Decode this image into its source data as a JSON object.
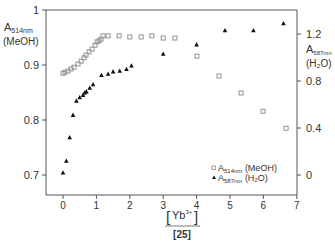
{
  "chart_data": {
    "type": "scatter",
    "title": "",
    "xlabel": "[Yb3+]/[25]",
    "xlabel_parts": {
      "num_main": "Yb",
      "num_sup": "3+",
      "den": "[25]"
    },
    "xlim": [
      -0.5,
      7
    ],
    "xticks": [
      0,
      1,
      2,
      3,
      4,
      5,
      6,
      7
    ],
    "y_left": {
      "label_main": "A",
      "label_sub": "514nm",
      "label_line2": "(MeOH)",
      "ylim": [
        0.66,
        1.0
      ],
      "ticks": [
        0.7,
        0.8,
        0.9,
        1
      ]
    },
    "y_right": {
      "label_main": "A",
      "label_sub": "587nm",
      "label_line2": "(H₂O)",
      "ylim": [
        -0.17,
        1.47
      ],
      "ticks": [
        0,
        0.4,
        0.8,
        1.2
      ]
    },
    "grid": false,
    "legend_position": "lower right",
    "series": [
      {
        "name": "A514nm (MeOH)",
        "legend_main": "A",
        "legend_sub": "514nm",
        "legend_rest": " (MeOH)",
        "marker": "open-square",
        "axis": "left",
        "x": [
          0.0,
          0.06,
          0.15,
          0.24,
          0.33,
          0.45,
          0.54,
          0.63,
          0.69,
          0.78,
          0.87,
          0.96,
          1.02,
          1.08,
          1.14,
          1.2,
          1.35,
          1.68,
          2.0,
          2.34,
          2.66,
          3.0,
          3.35,
          4.01,
          4.67,
          5.33,
          5.99,
          6.68
        ],
        "y": [
          0.885,
          0.887,
          0.889,
          0.893,
          0.896,
          0.902,
          0.907,
          0.913,
          0.918,
          0.924,
          0.929,
          0.936,
          0.942,
          0.944,
          0.947,
          0.953,
          0.953,
          0.953,
          0.951,
          0.951,
          0.953,
          0.949,
          0.949,
          0.916,
          0.88,
          0.849,
          0.816,
          0.785
        ]
      },
      {
        "name": "A587nm (H2O)",
        "legend_main": "A",
        "legend_sub": "587nm",
        "legend_rest": " (H₂O)",
        "marker": "filled-triangle",
        "axis": "right",
        "x": [
          0.0,
          0.1,
          0.2,
          0.3,
          0.4,
          0.5,
          0.6,
          0.65,
          0.7,
          0.8,
          0.9,
          1.15,
          1.35,
          1.5,
          1.7,
          1.9,
          2.05,
          3.0,
          4.0,
          4.85,
          5.7,
          6.6
        ],
        "y": [
          0.02,
          0.12,
          0.32,
          0.51,
          0.63,
          0.66,
          0.68,
          0.7,
          0.71,
          0.74,
          0.77,
          0.85,
          0.86,
          0.88,
          0.885,
          0.9,
          0.93,
          1.03,
          1.11,
          1.23,
          1.23,
          1.29
        ]
      }
    ]
  },
  "colors": {
    "axis": "#555555",
    "square": "#888888",
    "triangle": "#111111",
    "text": "#333333"
  }
}
